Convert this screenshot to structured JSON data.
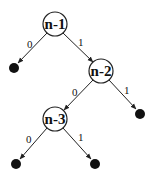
{
  "diagram": {
    "type": "binary-tree",
    "nodes": [
      {
        "id": "n1",
        "label": "n-1",
        "x": 55,
        "y": 24
      },
      {
        "id": "n2",
        "label": "n-2",
        "x": 101,
        "y": 71
      },
      {
        "id": "n3",
        "label": "n-3",
        "x": 55,
        "y": 119
      }
    ],
    "leaves": [
      {
        "id": "leaf1",
        "x": 14,
        "y": 68
      },
      {
        "id": "leaf2",
        "x": 140,
        "y": 114
      },
      {
        "id": "leaf3",
        "x": 16,
        "y": 164
      },
      {
        "id": "leaf4",
        "x": 95,
        "y": 164
      }
    ],
    "edges": [
      {
        "from": "n1",
        "to": "leaf1",
        "label": "0"
      },
      {
        "from": "n1",
        "to": "n2",
        "label": "1"
      },
      {
        "from": "n2",
        "to": "n3",
        "label": "0"
      },
      {
        "from": "n2",
        "to": "leaf2",
        "label": "1"
      },
      {
        "from": "n3",
        "to": "leaf3",
        "label": "0"
      },
      {
        "from": "n3",
        "to": "leaf4",
        "label": "1"
      }
    ],
    "colors": {
      "stroke": "#222222",
      "leaf": "#111111",
      "background": "#ffffff"
    }
  }
}
